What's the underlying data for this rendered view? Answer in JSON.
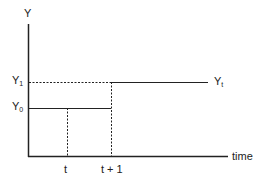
{
  "diagram": {
    "axes": {
      "y_label": "Y",
      "x_label": "time"
    },
    "levels": {
      "y1": {
        "base": "Y",
        "sub": "1"
      },
      "y0": {
        "base": "Y",
        "sub": "0"
      },
      "yt": {
        "base": "Y",
        "sub": "t"
      }
    },
    "ticks": {
      "t": "t",
      "t_plus_1": "t + 1"
    },
    "colors": {
      "line": "#222222",
      "background": "#ffffff"
    }
  }
}
